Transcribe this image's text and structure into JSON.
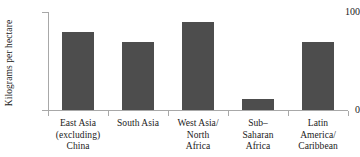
{
  "chart_data": {
    "type": "bar",
    "title": "",
    "xlabel": "",
    "ylabel": "Kilograms per hectare",
    "ylim": [
      0,
      100
    ],
    "yticks": [
      "0",
      "100"
    ],
    "grid": false,
    "legend": false,
    "bar_color": "#4d4d4d",
    "axis_color": "#a8a8a8",
    "categories": [
      "East Asia (excluding) China",
      "South Asia",
      "West Asia/ North Africa",
      "Sub-Saharan Africa",
      "Latin America/ Caribbean"
    ],
    "category_lines": [
      [
        "East Asia",
        "(excluding)",
        "China"
      ],
      [
        "South Asia"
      ],
      [
        "West Asia/",
        "North",
        "Africa"
      ],
      [
        "Sub–",
        "Saharan",
        "Africa"
      ],
      [
        "Latin",
        "America/",
        "Caribbean"
      ]
    ],
    "values": [
      80,
      69,
      90,
      11,
      69
    ]
  }
}
